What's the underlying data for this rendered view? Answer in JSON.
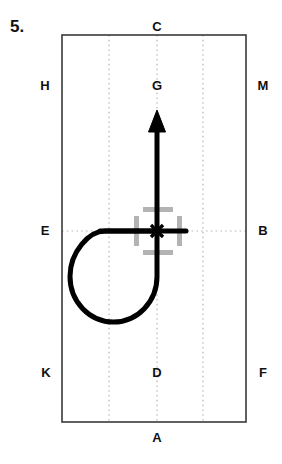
{
  "figure": {
    "number_label": "5.",
    "type": "dressage-arena-diagram",
    "colors": {
      "arena_outline": "#3a3a3a",
      "centre_line": "#b8b8b8",
      "path": "#000000",
      "marker_square": "#b3b3b3",
      "label_text": "#111111"
    }
  },
  "arena": {
    "outline": {
      "x": 62,
      "y": 35,
      "width": 184,
      "height": 387
    },
    "dotted_vertical_lines_x": [
      109,
      157,
      203
    ],
    "dotted_horizontal_lines_y": [
      231
    ]
  },
  "markers": [
    {
      "id": "C",
      "label": "C",
      "x": 157,
      "y": 27,
      "position": "top-centre"
    },
    {
      "id": "H",
      "label": "H",
      "x": 45,
      "y": 86,
      "position": "left-upper"
    },
    {
      "id": "G",
      "label": "G",
      "x": 157,
      "y": 86,
      "position": "centre-upper"
    },
    {
      "id": "M",
      "label": "M",
      "x": 263,
      "y": 86,
      "position": "right-upper"
    },
    {
      "id": "E",
      "label": "E",
      "x": 45,
      "y": 231,
      "position": "left-middle"
    },
    {
      "id": "B",
      "label": "B",
      "x": 263,
      "y": 231,
      "position": "right-middle"
    },
    {
      "id": "K",
      "label": "K",
      "x": 46,
      "y": 373,
      "position": "left-lower"
    },
    {
      "id": "D",
      "label": "D",
      "x": 157,
      "y": 373,
      "position": "centre-lower"
    },
    {
      "id": "F",
      "label": "F",
      "x": 263,
      "y": 373,
      "position": "right-lower"
    },
    {
      "id": "A",
      "label": "A",
      "x": 157,
      "y": 438,
      "position": "bottom-centre"
    }
  ],
  "path": {
    "stroke_width": 5,
    "loop": {
      "description": "circular volte starting at the E-B line going left then looping clockwise-down back up to the centre line",
      "leftmost_x": 70,
      "bottom_y": 322,
      "rejoin_x": 157,
      "top_y": 231
    },
    "straight_segment": {
      "from_x": 100,
      "to_x": 186,
      "y": 231
    },
    "arrow": {
      "from_y": 231,
      "to_y": 110,
      "x": 157,
      "head_width": 17,
      "head_length": 22,
      "direction": "up"
    }
  },
  "target_square": {
    "description": "grey broken square marking the centre point, with a black cross at its centre",
    "left": 134,
    "top": 207,
    "size": 48,
    "stroke_width": 5,
    "gap": 9,
    "centre": {
      "x": 157,
      "y": 231
    }
  }
}
